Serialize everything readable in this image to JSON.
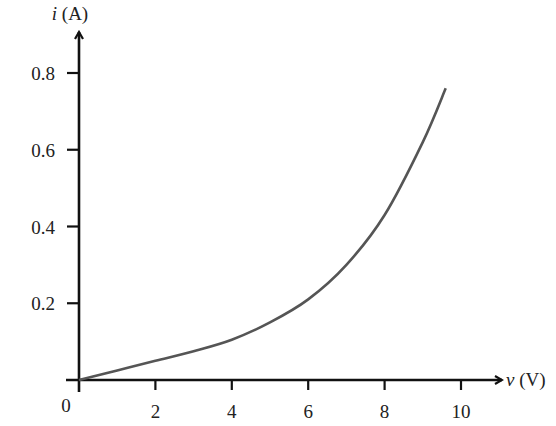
{
  "chart_data": {
    "type": "line",
    "title": "",
    "xlabel": "v (V)",
    "ylabel": "i (A)",
    "x_var": "v",
    "x_unit": "(V)",
    "y_var": "i",
    "y_unit": "(A)",
    "origin_label": "0",
    "xlim": [
      0,
      11
    ],
    "ylim": [
      0,
      0.9
    ],
    "x_ticks": [
      2,
      4,
      6,
      8,
      10
    ],
    "x_tick_labels": [
      "2",
      "4",
      "6",
      "8",
      "10"
    ],
    "y_ticks": [
      0.2,
      0.4,
      0.6,
      0.8
    ],
    "y_tick_labels": [
      "0.2",
      "0.4",
      "0.6",
      "0.8"
    ],
    "grid": false,
    "legend": null,
    "series": [
      {
        "name": "i-v characteristic",
        "color": "#555555",
        "x": [
          0,
          1,
          2,
          3,
          4,
          5,
          6,
          7,
          8,
          9,
          9.6
        ],
        "y": [
          0,
          0.025,
          0.05,
          0.075,
          0.105,
          0.15,
          0.21,
          0.3,
          0.43,
          0.62,
          0.76
        ]
      }
    ]
  }
}
